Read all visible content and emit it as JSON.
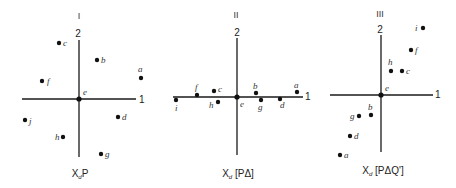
{
  "panels": [
    {
      "id": "I",
      "roman": "I",
      "caption_main": "X",
      "caption_sub": "d",
      "caption_rest": "P",
      "axis_x_label": "1",
      "axis_y_label": "2",
      "origin": [
        79,
        99
      ],
      "points": [
        {
          "label": "a",
          "x": 141,
          "y": 78
        },
        {
          "label": "b",
          "x": 97,
          "y": 60
        },
        {
          "label": "c",
          "x": 59,
          "y": 43
        },
        {
          "label": "d",
          "x": 118,
          "y": 117
        },
        {
          "label": "e",
          "x": 79,
          "y": 99
        },
        {
          "label": "f",
          "x": 42,
          "y": 81
        },
        {
          "label": "g",
          "x": 101,
          "y": 154
        },
        {
          "label": "h",
          "x": 63,
          "y": 137
        },
        {
          "label": "j",
          "x": 25,
          "y": 120
        }
      ]
    },
    {
      "id": "II",
      "roman": "II",
      "caption_main": "X",
      "caption_sub": "d",
      "caption_rest": " [PΔ]",
      "axis_x_label": "1",
      "axis_y_label": "2",
      "origin": [
        237,
        97
      ],
      "points": [
        {
          "label": "a",
          "x": 297,
          "y": 92
        },
        {
          "label": "b",
          "x": 256,
          "y": 93
        },
        {
          "label": "c",
          "x": 214,
          "y": 91
        },
        {
          "label": "d",
          "x": 280,
          "y": 99
        },
        {
          "label": "e",
          "x": 237,
          "y": 97
        },
        {
          "label": "f",
          "x": 197,
          "y": 95
        },
        {
          "label": "g",
          "x": 261,
          "y": 100
        },
        {
          "label": "h",
          "x": 218,
          "y": 102
        },
        {
          "label": "i",
          "x": 176,
          "y": 100
        }
      ]
    },
    {
      "id": "III",
      "roman": "III",
      "caption_main": "X",
      "caption_sub": "d",
      "caption_rest": " [PΔQ']",
      "axis_x_label": "1",
      "axis_y_label": "2",
      "origin": [
        381,
        95
      ],
      "points": [
        {
          "label": "a",
          "x": 340,
          "y": 155
        },
        {
          "label": "b",
          "x": 371,
          "y": 115
        },
        {
          "label": "c",
          "x": 402,
          "y": 71
        },
        {
          "label": "d",
          "x": 350,
          "y": 136
        },
        {
          "label": "e",
          "x": 381,
          "y": 95
        },
        {
          "label": "f",
          "x": 411,
          "y": 50
        },
        {
          "label": "g",
          "x": 359,
          "y": 116
        },
        {
          "label": "h",
          "x": 391,
          "y": 71
        },
        {
          "label": "i",
          "x": 423,
          "y": 28
        }
      ]
    }
  ]
}
